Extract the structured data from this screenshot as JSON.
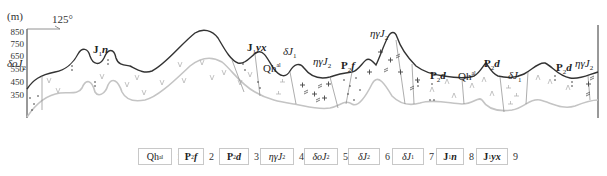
{
  "figure": {
    "type": "geological-cross-section",
    "y_axis": {
      "unit": "(m)",
      "ticks": [
        "850",
        "750",
        "650",
        "550",
        "450",
        "350"
      ]
    },
    "orientation": {
      "azimuth": "125°"
    },
    "section_labels": [
      {
        "text": "δοJ",
        "sub": "2",
        "x": 7,
        "y": 58
      },
      {
        "text": "J",
        "sub": "1",
        "tail": "n",
        "x": 93,
        "y": 44
      },
      {
        "text": "J",
        "sub": "1",
        "tail": "yx",
        "x": 247,
        "y": 42
      },
      {
        "text": "δJ",
        "sub": "1",
        "x": 283,
        "y": 46
      },
      {
        "text": "Qh",
        "sup": "al",
        "x": 263,
        "y": 62
      },
      {
        "text": "ηγJ",
        "sub": "2",
        "x": 313,
        "y": 56
      },
      {
        "text": "P",
        "sub": "2",
        "tail": "f",
        "x": 341,
        "y": 60
      },
      {
        "text": "ηγJ",
        "sub": "2",
        "x": 370,
        "y": 28
      },
      {
        "text": "P",
        "sub": "2",
        "tail": "d",
        "x": 430,
        "y": 70
      },
      {
        "text": "Qh",
        "sup": "al",
        "x": 458,
        "y": 70
      },
      {
        "text": "P",
        "sub": "2",
        "tail": "d",
        "x": 484,
        "y": 58
      },
      {
        "text": "δJ",
        "sub": "1",
        "x": 508,
        "y": 70
      },
      {
        "text": "P",
        "sub": "2",
        "tail": "d",
        "x": 556,
        "y": 62
      },
      {
        "text": "ηγJ",
        "sub": "2",
        "x": 575,
        "y": 58
      }
    ]
  },
  "legend": {
    "items": [
      {
        "num": "1",
        "label": "Qh",
        "sup": "al",
        "name": "quaternary-alluvium"
      },
      {
        "num": "2",
        "label": "P",
        "sub": "2",
        "tail": "f",
        "name": "p2f"
      },
      {
        "num": "3",
        "label": "P",
        "sub": "2",
        "tail": "d",
        "name": "p2d"
      },
      {
        "num": "4",
        "label": "ηγJ",
        "sub": "2",
        "name": "monzogranite-j2"
      },
      {
        "num": "5",
        "label": "δοJ",
        "sub": "2",
        "name": "quartz-diorite-j2"
      },
      {
        "num": "6",
        "label": "δJ",
        "sub": "2",
        "name": "diorite-j2"
      },
      {
        "num": "7",
        "label": "δJ",
        "sub": "1",
        "name": "diorite-j1"
      },
      {
        "num": "8",
        "label": "J",
        "sub": "1",
        "tail": "n",
        "name": "j1n"
      },
      {
        "num": "9",
        "label": "J",
        "sub": "1",
        "tail": "yx",
        "name": "j1yx"
      }
    ]
  },
  "colors": {
    "surface_line": "#333333",
    "base_line": "#c4c4c4",
    "pattern": "#9a9a9a",
    "text": "#222222"
  }
}
